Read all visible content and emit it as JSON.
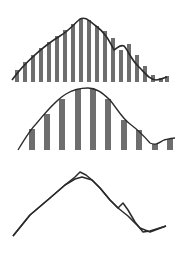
{
  "diagram": {
    "colors": {
      "bar": "#6e6e6e",
      "curve": "#2a2a2a",
      "background": "#ffffff"
    }
  },
  "chart_data": [
    {
      "type": "bar",
      "title": "",
      "note": "dense sampling (20 bars) under smooth curve",
      "baseline_y": 82,
      "x": [
        17,
        25,
        33,
        41,
        49,
        57,
        65,
        73,
        81,
        89,
        97,
        105,
        113,
        121,
        129,
        137,
        145,
        153,
        161,
        167
      ],
      "tops": [
        70,
        62,
        55,
        48,
        42,
        36,
        30,
        24,
        19,
        20,
        26,
        31,
        38,
        50,
        44,
        55,
        66,
        75,
        78,
        76
      ]
    },
    {
      "type": "bar",
      "title": "",
      "note": "sparse sampling (10 bars) under smooth curve",
      "baseline_y": 150,
      "x": [
        32,
        47,
        62,
        78,
        93,
        108,
        124,
        139,
        155,
        170
      ],
      "tops": [
        129,
        114,
        99,
        89,
        89,
        99,
        120,
        130,
        144,
        139
      ]
    },
    {
      "type": "line",
      "title": "",
      "note": "original curve vs reconstructed curve",
      "series": [
        {
          "name": "original",
          "points": [
            [
              13,
              236
            ],
            [
              30,
              215
            ],
            [
              50,
              198
            ],
            [
              65,
              185
            ],
            [
              75,
              177
            ],
            [
              80,
              172
            ],
            [
              86,
              175
            ],
            [
              92,
              180
            ],
            [
              100,
              188
            ],
            [
              110,
              200
            ],
            [
              118,
              208
            ],
            [
              123,
              203
            ],
            [
              128,
              210
            ],
            [
              135,
              222
            ],
            [
              143,
              232
            ],
            [
              150,
              231
            ],
            [
              166,
              226
            ]
          ]
        },
        {
          "name": "reconstructed",
          "points": [
            [
              13,
              236
            ],
            [
              30,
              215
            ],
            [
              50,
              198
            ],
            [
              65,
              185
            ],
            [
              75,
              179
            ],
            [
              82,
              177
            ],
            [
              92,
              180
            ],
            [
              100,
              188
            ],
            [
              110,
              200
            ],
            [
              118,
              208
            ],
            [
              128,
              216
            ],
            [
              140,
              228
            ],
            [
              150,
              232
            ],
            [
              166,
              226
            ]
          ]
        }
      ]
    }
  ]
}
